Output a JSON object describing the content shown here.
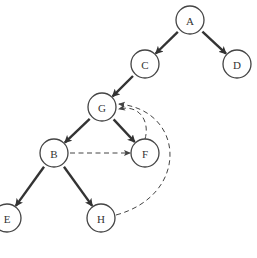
{
  "diagram": {
    "type": "graph-traversal",
    "radius": 14,
    "nodes": [
      {
        "id": "A",
        "label": "A",
        "x": 190,
        "y": 20
      },
      {
        "id": "C",
        "label": "C",
        "x": 145,
        "y": 64
      },
      {
        "id": "D",
        "label": "D",
        "x": 237,
        "y": 64
      },
      {
        "id": "G",
        "label": "G",
        "x": 102,
        "y": 107
      },
      {
        "id": "B",
        "label": "B",
        "x": 54,
        "y": 153
      },
      {
        "id": "F",
        "label": "F",
        "x": 145,
        "y": 153
      },
      {
        "id": "E",
        "label": "E",
        "x": 7,
        "y": 218
      },
      {
        "id": "H",
        "label": "H",
        "x": 101,
        "y": 218
      }
    ],
    "tree_edges": [
      {
        "from": "A",
        "to": "C"
      },
      {
        "from": "A",
        "to": "D"
      },
      {
        "from": "C",
        "to": "G"
      },
      {
        "from": "G",
        "to": "B"
      },
      {
        "from": "G",
        "to": "F"
      },
      {
        "from": "B",
        "to": "E"
      },
      {
        "from": "B",
        "to": "H"
      }
    ],
    "dashed_edges": [
      {
        "from": "B",
        "to": "F"
      },
      {
        "from": "F",
        "to": "G"
      },
      {
        "from": "H",
        "to": "G"
      }
    ],
    "colors": {
      "node_stroke": "#444444",
      "edge": "#333333",
      "background": "#ffffff"
    }
  }
}
